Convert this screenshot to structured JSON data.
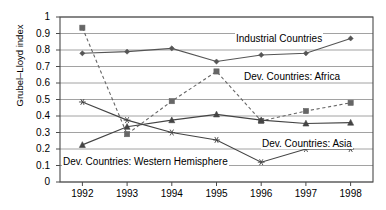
{
  "chart_data": {
    "type": "line",
    "title": "",
    "xlabel": "",
    "ylabel": "Grubel–Lloyd index",
    "x": [
      1992,
      1993,
      1994,
      1995,
      1996,
      1997,
      1998
    ],
    "xticklabels": [
      "1992",
      "1993",
      "1994",
      "1995",
      "1996",
      "1997",
      "1998"
    ],
    "ylim": [
      0,
      1
    ],
    "yticks": [
      0,
      0.1,
      0.2,
      0.3,
      0.4,
      0.5,
      0.6,
      0.7,
      0.8,
      0.9,
      1
    ],
    "yticklabels": [
      "0",
      "0.1",
      "0.2",
      "0.3",
      "0.4",
      "0.5",
      "0.6",
      "0.7",
      "0.8",
      "0.9",
      "1"
    ],
    "grid": true,
    "legend_position": "inline-annotations",
    "series": [
      {
        "name": "Industrial Countries",
        "values": [
          0.78,
          0.79,
          0.81,
          0.73,
          0.77,
          0.78,
          0.87
        ],
        "style": "solid",
        "marker": "diamond",
        "color": "#555555",
        "label_x": 235,
        "label_y": 36
      },
      {
        "name": "Dev. Countries: Africa",
        "values": [
          0.935,
          0.29,
          0.49,
          0.67,
          0.37,
          0.43,
          0.48
        ],
        "style": "dashed",
        "marker": "square",
        "color": "#666666",
        "label_x": 243,
        "label_y": 73
      },
      {
        "name": "Dev. Countries: Asia",
        "values": [
          0.225,
          0.335,
          0.375,
          0.41,
          0.375,
          0.355,
          0.36
        ],
        "style": "solid",
        "marker": "triangle",
        "color": "#444444",
        "label_x": 261,
        "label_y": 140
      },
      {
        "name": "Dev. Countries: Western Hemisphere",
        "values": [
          0.485,
          0.375,
          0.3,
          0.255,
          0.12,
          0.2,
          0.2
        ],
        "style": "solid",
        "marker": "star",
        "color": "#444444",
        "label_x": 62,
        "label_y": 157
      }
    ]
  },
  "axis": {
    "y_label": "Grubel–Lloyd index",
    "y_ticks": [
      "1",
      "0.9",
      "0.8",
      "0.7",
      "0.6",
      "0.5",
      "0.4",
      "0.3",
      "0.2",
      "0.1",
      "0"
    ],
    "x_ticks": [
      "1992",
      "1993",
      "1994",
      "1995",
      "1996",
      "1997",
      "1998"
    ]
  },
  "annotations": {
    "industrial": "Industrial Countries",
    "africa": "Dev. Countries: Africa",
    "asia": "Dev. Countries: Asia",
    "western": "Dev. Countries: Western Hemisphere"
  }
}
